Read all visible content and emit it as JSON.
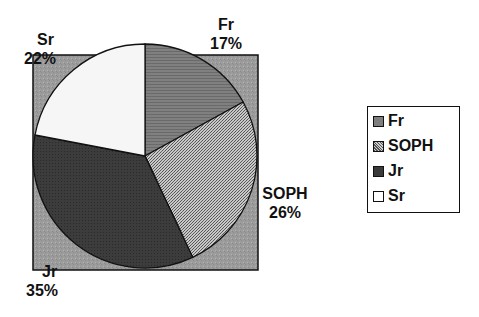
{
  "chart_data": {
    "type": "pie",
    "title": "",
    "categories": [
      "Fr",
      "SOPH",
      "Jr",
      "Sr"
    ],
    "values": [
      17,
      26,
      35,
      22
    ],
    "unit": "%",
    "start_angle_deg": 0,
    "direction": "clockwise",
    "data_labels": [
      {
        "name": "Fr",
        "pct": "17%"
      },
      {
        "name": "SOPH",
        "pct": "26%"
      },
      {
        "name": "Jr",
        "pct": "35%"
      },
      {
        "name": "Sr",
        "pct": "22%"
      }
    ],
    "colors": {
      "Fr": "#7a7a7a",
      "SOPH": "#a8a8a8",
      "Jr": "#3a3a3a",
      "Sr": "#f4f4f4",
      "plot_background": "#9a9a9a"
    },
    "legend": {
      "position": "right",
      "entries": [
        "Fr",
        "SOPH",
        "Jr",
        "Sr"
      ]
    }
  }
}
